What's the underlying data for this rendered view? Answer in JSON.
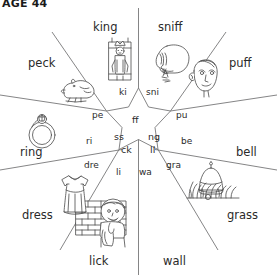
{
  "header": {
    "text": "AGE 44"
  },
  "wheel": {
    "title": "phonics word wheel",
    "center_endings": [
      {
        "id": "ff",
        "text": "ff"
      },
      {
        "id": "ng",
        "text": "ng"
      },
      {
        "id": "ss",
        "text": "ss"
      },
      {
        "id": "ck",
        "text": "ck"
      },
      {
        "id": "ll",
        "text": "ll"
      }
    ],
    "segments": [
      {
        "id": "peck",
        "word": "peck",
        "onset": "pe",
        "icon": "chicken-icon"
      },
      {
        "id": "king",
        "word": "king",
        "onset": "ki",
        "icon": "king-icon"
      },
      {
        "id": "sniff",
        "word": "sniff",
        "onset": "sni",
        "icon": "sniffing-face-icon"
      },
      {
        "id": "puff",
        "word": "puff",
        "onset": "pu",
        "icon": "puffing-face-icon"
      },
      {
        "id": "bell",
        "word": "bell",
        "onset": "be",
        "icon": "bell-icon"
      },
      {
        "id": "grass",
        "word": "grass",
        "onset": "gra",
        "icon": "grass-icon"
      },
      {
        "id": "wall",
        "word": "wall",
        "onset": "wa",
        "icon": "brick-wall-icon"
      },
      {
        "id": "lick",
        "word": "lick",
        "onset": "li",
        "icon": "licking-child-icon"
      },
      {
        "id": "dress",
        "word": "dress",
        "onset": "dre",
        "icon": "dress-icon"
      },
      {
        "id": "ring",
        "word": "ring",
        "onset": "ri",
        "icon": "ring-icon"
      }
    ]
  },
  "colors": {
    "line": "#6f6f70",
    "ink": "#2a2a2a",
    "art": "#4a4a4a",
    "paper": "#ffffff"
  }
}
